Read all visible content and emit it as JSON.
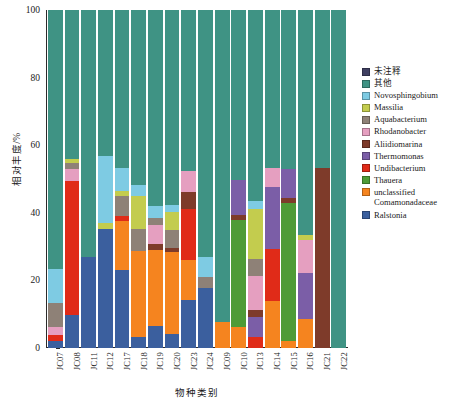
{
  "axes": {
    "y_title": "相对丰度/%",
    "x_title": "物种类别",
    "y_ticks": [
      "0",
      "20",
      "40",
      "60",
      "80",
      "100"
    ]
  },
  "chart_data": {
    "type": "bar",
    "title": "",
    "subtitle": "",
    "xlabel": "物种类别",
    "ylabel": "相对丰度/%",
    "stacked": true,
    "stack_total": 100,
    "ylim": [
      0,
      100
    ],
    "yticks": [
      0,
      20,
      40,
      60,
      80,
      100
    ],
    "grid": false,
    "legend_position": "right",
    "categories": [
      "JC07",
      "JC08",
      "JC11",
      "JC12",
      "JC17",
      "JC18",
      "JC19",
      "JC20",
      "JC23",
      "JC24",
      "JC09",
      "JC10",
      "JC13",
      "JC14",
      "JC15",
      "JC16",
      "JC21",
      "JC22"
    ],
    "legend": [
      "未注释",
      "其他",
      "Novosphingobium",
      "Massilia",
      "Aquabacterium",
      "Rhodanobacter",
      "Aliidiomarina",
      "Thermomonas",
      "Undibacterium",
      "Thauera",
      "unclassified\nComamonadaceae",
      "Ralstonia"
    ],
    "colors": {
      "未注释": "#3f3f61",
      "其他": "#3f9384",
      "Novosphingobium": "#7ecbe3",
      "Massilia": "#c3cc4e",
      "Aquabacterium": "#8e8177",
      "Rhodanobacter": "#e59fc0",
      "Aliidiomarina": "#7e3b2a",
      "Thermomonas": "#7b5ea7",
      "Undibacterium": "#e02b18",
      "Thauera": "#4e9b37",
      "unclassified Comamonadaceae": "#f5841f",
      "Ralstonia": "#3b5f9e"
    },
    "series": [
      {
        "name": "Ralstonia",
        "values": [
          2.0,
          9.5,
          27.0,
          23.5,
          3.0,
          3.5,
          6.5,
          4.0,
          14.0,
          17.5,
          0.0,
          0.0,
          0.0,
          0.0,
          0.0,
          0.0,
          0.0,
          0.0
        ]
      },
      {
        "name": "unclassified Comamonadaceae",
        "values": [
          0.0,
          0.0,
          0.0,
          0.0,
          0.0,
          0.0,
          0.0,
          0.0,
          0.0,
          0.0,
          7.5,
          0.0,
          4.0,
          0.0,
          0.0,
          8.5,
          0.0,
          0.0
        ]
      },
      {
        "name": "Thauera",
        "values": [
          0.0,
          0.0,
          0.0,
          0.0,
          0.0,
          0.0,
          0.0,
          0.0,
          0.0,
          0.0,
          0.0,
          2.5,
          0.0,
          1.0,
          0.0,
          0.0,
          0.0,
          0.0
        ]
      },
      {
        "name": "Undibacterium",
        "values": [
          1.5,
          0.0,
          0.0,
          0.0,
          0.0,
          0.0,
          0.0,
          0.0,
          0.0,
          0.0,
          0.0,
          0.0,
          0.0,
          0.0,
          0.0,
          0.0,
          0.0,
          0.0
        ]
      },
      {
        "name": "Thermomonas",
        "values": [
          0.0,
          0.0,
          0.0,
          0.0,
          0.0,
          0.0,
          0.0,
          0.0,
          0.0,
          0.0,
          0.0,
          5.0,
          0.0,
          2.5,
          0.0,
          0.0,
          0.0,
          0.0
        ]
      },
      {
        "name": "Aliidiomarina",
        "values": [
          0.0,
          0.0,
          0.0,
          0.0,
          0.0,
          0.0,
          0.0,
          0.0,
          0.0,
          0.0,
          0.0,
          0.0,
          0.0,
          0.0,
          0.0,
          0.0,
          53.0,
          0.0
        ]
      },
      {
        "name": "Rhodanobacter",
        "values": [
          2.5,
          0.0,
          0.0,
          0.0,
          0.0,
          0.0,
          0.0,
          0.0,
          0.0,
          0.0,
          0.0,
          0.0,
          0.0,
          0.0,
          0.0,
          0.0,
          0.0,
          0.0
        ]
      },
      {
        "name": "Aquabacterium",
        "values": [
          7.0,
          0.0,
          0.0,
          0.0,
          0.0,
          0.0,
          0.0,
          0.0,
          0.0,
          0.0,
          0.0,
          0.0,
          0.0,
          0.0,
          0.0,
          0.0,
          0.0,
          0.0
        ]
      },
      {
        "name": "Massilia",
        "values": [
          0.0,
          0.0,
          0.0,
          0.0,
          0.0,
          0.0,
          0.0,
          0.0,
          0.0,
          0.0,
          0.0,
          0.0,
          0.0,
          0.0,
          0.0,
          0.0,
          0.0,
          0.0
        ]
      },
      {
        "name": "Novosphingobium",
        "values": [
          10.0,
          0.0,
          0.0,
          8.0,
          0.0,
          0.0,
          0.0,
          0.0,
          0.0,
          0.0,
          0.0,
          0.0,
          0.0,
          0.0,
          0.0,
          0.0,
          0.0,
          0.0
        ]
      },
      {
        "name": "其他",
        "values": [
          77.0,
          90.5,
          73.0,
          68.5,
          97.0,
          96.5,
          93.5,
          96.0,
          86.0,
          82.5,
          92.5,
          92.5,
          96.0,
          96.5,
          100.0,
          91.5,
          47.0,
          100.0
        ]
      },
      {
        "name": "未注释",
        "values": [
          0.0,
          0.0,
          0.0,
          0.0,
          0.0,
          0.0,
          0.0,
          0.0,
          0.0,
          0.0,
          0.0,
          0.0,
          0.0,
          0.0,
          0.0,
          0.0,
          0.0,
          0.0
        ]
      }
    ],
    "bars": [
      {
        "category": "JC07",
        "segments": [
          {
            "name": "Ralstonia",
            "value": 2.2
          },
          {
            "name": "Undibacterium",
            "value": 1.6
          },
          {
            "name": "Rhodanobacter",
            "value": 2.4
          },
          {
            "name": "Aquabacterium",
            "value": 7.2
          },
          {
            "name": "Novosphingobium",
            "value": 10.1
          },
          {
            "name": "其他",
            "value": 76.5
          }
        ]
      },
      {
        "category": "JC08",
        "segments": [
          {
            "name": "Ralstonia",
            "value": 9.7
          },
          {
            "name": "Undibacterium",
            "value": 39.6
          },
          {
            "name": "Rhodanobacter",
            "value": 3.8
          },
          {
            "name": "Aquabacterium",
            "value": 1.6
          },
          {
            "name": "Massilia",
            "value": 1.3
          },
          {
            "name": "其他",
            "value": 44.0
          }
        ]
      },
      {
        "category": "JC11",
        "segments": [
          {
            "name": "Ralstonia",
            "value": 26.9
          },
          {
            "name": "其他",
            "value": 73.1
          }
        ]
      },
      {
        "category": "JC12",
        "segments": [
          {
            "name": "Ralstonia",
            "value": 35.3
          },
          {
            "name": "Massilia",
            "value": 1.8
          },
          {
            "name": "Novosphingobium",
            "value": 19.7
          },
          {
            "name": "其他",
            "value": 43.2
          }
        ]
      },
      {
        "category": "JC17",
        "segments": [
          {
            "name": "Ralstonia",
            "value": 23.2
          },
          {
            "name": "unclassified Comamonadaceae",
            "value": 14.5
          },
          {
            "name": "Undibacterium",
            "value": 1.4
          },
          {
            "name": "Aquabacterium",
            "value": 6.0
          },
          {
            "name": "Massilia",
            "value": 1.5
          },
          {
            "name": "Novosphingobium",
            "value": 6.6
          },
          {
            "name": "其他",
            "value": 46.8
          }
        ]
      },
      {
        "category": "JC18",
        "segments": [
          {
            "name": "Ralstonia",
            "value": 3.4
          },
          {
            "name": "unclassified Comamonadaceae",
            "value": 25.3
          },
          {
            "name": "Aquabacterium",
            "value": 6.5
          },
          {
            "name": "Massilia",
            "value": 9.8
          },
          {
            "name": "Novosphingobium",
            "value": 3.1
          },
          {
            "name": "其他",
            "value": 51.9
          }
        ]
      },
      {
        "category": "JC19",
        "segments": [
          {
            "name": "Ralstonia",
            "value": 6.6
          },
          {
            "name": "unclassified Comamonadaceae",
            "value": 22.5
          },
          {
            "name": "Aliidiomarina",
            "value": 1.6
          },
          {
            "name": "Rhodanobacter",
            "value": 5.7
          },
          {
            "name": "Aquabacterium",
            "value": 2.2
          },
          {
            "name": "Novosphingobium",
            "value": 3.4
          },
          {
            "name": "其他",
            "value": 58.0
          }
        ]
      },
      {
        "category": "JC20",
        "segments": [
          {
            "name": "Ralstonia",
            "value": 4.1
          },
          {
            "name": "unclassified Comamonadaceae",
            "value": 24.2
          },
          {
            "name": "Aliidiomarina",
            "value": 1.4
          },
          {
            "name": "Aquabacterium",
            "value": 5.1
          },
          {
            "name": "Massilia",
            "value": 5.6
          },
          {
            "name": "Novosphingobium",
            "value": 2.0
          },
          {
            "name": "其他",
            "value": 57.6
          }
        ]
      },
      {
        "category": "JC23",
        "segments": [
          {
            "name": "Ralstonia",
            "value": 14.1
          },
          {
            "name": "unclassified Comamonadaceae",
            "value": 11.9
          },
          {
            "name": "Undibacterium",
            "value": 15.1
          },
          {
            "name": "Aliidiomarina",
            "value": 5.2
          },
          {
            "name": "Rhodanobacter",
            "value": 6.1
          },
          {
            "name": "其他",
            "value": 47.6
          }
        ]
      },
      {
        "category": "JC24",
        "segments": [
          {
            "name": "Ralstonia",
            "value": 17.8
          },
          {
            "name": "Aquabacterium",
            "value": 3.3
          },
          {
            "name": "Novosphingobium",
            "value": 5.9
          },
          {
            "name": "其他",
            "value": 73.0
          }
        ]
      },
      {
        "category": "JC09",
        "segments": [
          {
            "name": "unclassified Comamonadaceae",
            "value": 7.6
          },
          {
            "name": "其他",
            "value": 92.4
          }
        ]
      },
      {
        "category": "JC10",
        "segments": [
          {
            "name": "unclassified Comamonadaceae",
            "value": 6.3
          },
          {
            "name": "Thauera",
            "value": 31.6
          },
          {
            "name": "Aliidiomarina",
            "value": 1.4
          },
          {
            "name": "Thermomonas",
            "value": 10.5
          },
          {
            "name": "其他",
            "value": 50.2
          }
        ]
      },
      {
        "category": "JC13",
        "segments": [
          {
            "name": "Undibacterium",
            "value": 3.4
          },
          {
            "name": "Thermomonas",
            "value": 5.8
          },
          {
            "name": "Aliidiomarina",
            "value": 2.0
          },
          {
            "name": "Rhodanobacter",
            "value": 10.0
          },
          {
            "name": "Aquabacterium",
            "value": 5.0
          },
          {
            "name": "Massilia",
            "value": 15.0
          },
          {
            "name": "Novosphingobium",
            "value": 2.2
          },
          {
            "name": "其他",
            "value": 56.6
          }
        ]
      },
      {
        "category": "JC14",
        "segments": [
          {
            "name": "unclassified Comamonadaceae",
            "value": 13.8
          },
          {
            "name": "Undibacterium",
            "value": 15.5
          },
          {
            "name": "Thermomonas",
            "value": 18.2
          },
          {
            "name": "Rhodanobacter",
            "value": 5.8
          },
          {
            "name": "其他",
            "value": 46.7
          }
        ]
      },
      {
        "category": "JC15",
        "segments": [
          {
            "name": "unclassified Comamonadaceae",
            "value": 2.0
          },
          {
            "name": "Thauera",
            "value": 40.8
          },
          {
            "name": "Aliidiomarina",
            "value": 1.5
          },
          {
            "name": "Thermomonas",
            "value": 8.7
          },
          {
            "name": "其他",
            "value": 47.0
          }
        ]
      },
      {
        "category": "JC16",
        "segments": [
          {
            "name": "unclassified Comamonadaceae",
            "value": 8.7
          },
          {
            "name": "Thermomonas",
            "value": 13.5
          },
          {
            "name": "Rhodanobacter",
            "value": 9.8
          },
          {
            "name": "Massilia",
            "value": 1.3
          },
          {
            "name": "其他",
            "value": 66.7
          }
        ]
      },
      {
        "category": "JC21",
        "segments": [
          {
            "name": "Aliidiomarina",
            "value": 53.3
          },
          {
            "name": "其他",
            "value": 46.7
          }
        ]
      },
      {
        "category": "JC22",
        "segments": [
          {
            "name": "其他",
            "value": 100.0
          }
        ]
      }
    ]
  }
}
